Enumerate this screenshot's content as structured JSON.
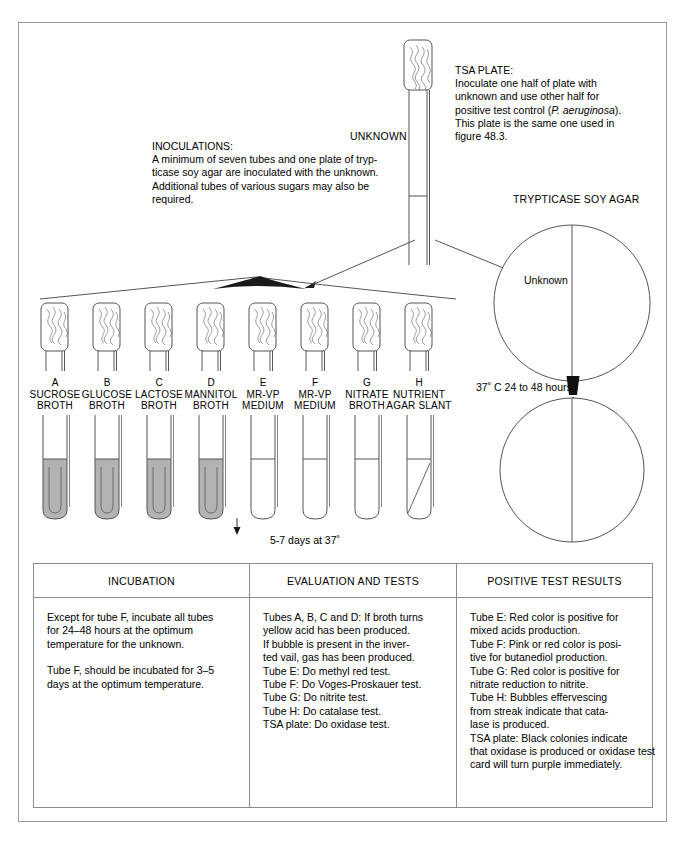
{
  "figure": {
    "unknown_tube_label": "UNKNOWN",
    "tsa_plate": {
      "title": "TSA PLATE:",
      "line1": "Inoculate one half of plate with",
      "line2": "unknown and use other half for",
      "line3_pre": "positive test control (",
      "line3_italic": "P. aeruginosa",
      "line3_post": ").",
      "line4": "This plate is the same one used in",
      "line5": "figure 48.3."
    },
    "inoculations": {
      "title": "INOCULATIONS:",
      "line1": "A minimum of seven tubes and one plate of tryp-",
      "line2": "ticase soy agar are inoculated with the unknown.",
      "line3": "Additional tubes of various sugars may also be",
      "line4": "required."
    },
    "agar_heading": "TRYPTICASE SOY AGAR",
    "plate_top_label": "Unknown",
    "incubation_arrow_label": "37˚ C 24 to 48 hours",
    "tube_incubation_label": "5-7 days at 37˚",
    "tubes": [
      {
        "letter": "A",
        "line1": "SUCROSE",
        "line2": "BROTH",
        "filled": true,
        "slant": false
      },
      {
        "letter": "B",
        "line1": "GLUCOSE",
        "line2": "BROTH",
        "filled": true,
        "slant": false
      },
      {
        "letter": "C",
        "line1": "LACTOSE",
        "line2": "BROTH",
        "filled": true,
        "slant": false
      },
      {
        "letter": "D",
        "line1": "MANNITOL",
        "line2": "BROTH",
        "filled": true,
        "slant": false
      },
      {
        "letter": "E",
        "line1": "MR-VP",
        "line2": "MEDIUM",
        "filled": false,
        "slant": false
      },
      {
        "letter": "F",
        "line1": "MR-VP",
        "line2": "MEDIUM",
        "filled": false,
        "slant": false
      },
      {
        "letter": "G",
        "line1": "NITRATE",
        "line2": "BROTH",
        "filled": false,
        "slant": false
      },
      {
        "letter": "H",
        "line1": "NUTRIENT",
        "line2": "AGAR SLANT",
        "filled": false,
        "slant": true
      }
    ]
  },
  "table": {
    "columns": [
      {
        "header": "INCUBATION",
        "paragraphs": [
          [
            "Except for tube F, incubate all tubes",
            "for 24–48 hours at the optimum",
            "temperature for the unknown."
          ],
          [
            "Tube F, should be incubated for 3–5",
            "days at the optimum temperature."
          ]
        ]
      },
      {
        "header": "EVALUATION AND TESTS",
        "paragraphs": [
          [
            "Tubes A, B, C and D: If broth turns",
            "yellow acid has been produced.",
            "If bubble is present in the inver-",
            "ted vail, gas has been produced.",
            "Tube E: Do methyl red test.",
            "Tube F: Do Voges-Proskauer test.",
            "Tube G: Do nitrite test.",
            "Tube H: Do catalase test.",
            "TSA plate: Do oxidase test."
          ]
        ]
      },
      {
        "header": "POSITIVE TEST RESULTS",
        "paragraphs": [
          [
            "Tube E: Red color is positive for",
            "mixed acids production.",
            "Tube F: Pink or red color is posi-",
            "tive for butanediol production.",
            "Tube G: Red color is positive for",
            "nitrate reduction to nitrite.",
            "Tube H: Bubbles effervescing",
            "from streak indicate that cata-",
            "lase is produced.",
            "TSA plate: Black colonies indicate",
            "that oxidase is produced or oxidase test",
            "card will turn purple immediately."
          ]
        ]
      }
    ]
  },
  "colors": {
    "line": "#555555",
    "frame": "#9a9a9a",
    "broth_fill": "#b3b3b3",
    "text": "#000000"
  }
}
